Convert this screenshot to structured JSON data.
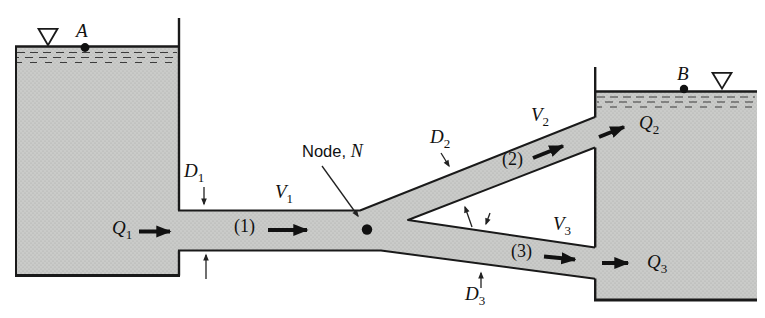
{
  "figure": {
    "background": "#ffffff",
    "fill_gray": "#cacbc9",
    "stipple_dot": "#a8a9a7",
    "line_color": "#1a1a1a"
  },
  "labels": {
    "surface_a": {
      "var": "A"
    },
    "surface_b": {
      "var": "B"
    },
    "q1": {
      "var": "Q",
      "sub": "1"
    },
    "d1": {
      "var": "D",
      "sub": "1"
    },
    "v1": {
      "var": "V",
      "sub": "1"
    },
    "pipe1": {
      "text": "(1)"
    },
    "node": {
      "word": "Node, ",
      "var": "N"
    },
    "d2": {
      "var": "D",
      "sub": "2"
    },
    "v2": {
      "var": "V",
      "sub": "2"
    },
    "pipe2": {
      "text": "(2)"
    },
    "q2": {
      "var": "Q",
      "sub": "2"
    },
    "v3": {
      "var": "V",
      "sub": "3"
    },
    "pipe3": {
      "text": "(3)"
    },
    "q3": {
      "var": "Q",
      "sub": "3"
    },
    "d3": {
      "var": "D",
      "sub": "3"
    }
  }
}
